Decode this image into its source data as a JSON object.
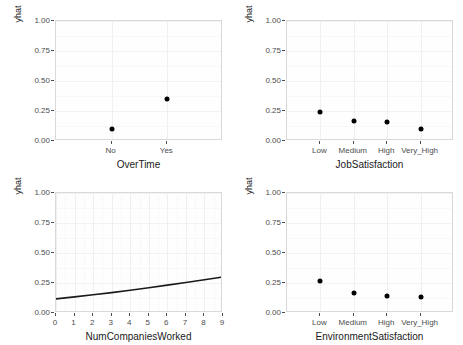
{
  "figure": {
    "width": 463,
    "height": 345,
    "background": "#ffffff",
    "panel_background": "#fefefe",
    "panel_border_color": "#d9d9d9",
    "gridline_major_color": "#f2f2f2",
    "gridline_minor_color": "#f8f8f8",
    "point_color": "#000000",
    "line_color": "#1a1a1a",
    "axis_text_color": "#4d4d4d",
    "axis_title_color": "#1a1a1a"
  },
  "chart_data": [
    {
      "id": "overtime",
      "type": "scatter",
      "title": "",
      "xlabel": "OverTime",
      "ylabel": "yhat",
      "categories": [
        "No",
        "Yes"
      ],
      "values": [
        0.1,
        0.35
      ],
      "ylim": [
        0.0,
        1.0
      ],
      "ytick_labels": [
        "0.00",
        "0.25",
        "0.50",
        "0.75",
        "1.00"
      ],
      "ytick_values": [
        0.0,
        0.25,
        0.5,
        0.75,
        1.0
      ],
      "grid": true,
      "legend": "none"
    },
    {
      "id": "jobsatisfaction",
      "type": "scatter",
      "title": "",
      "xlabel": "JobSatisfaction",
      "ylabel": "yhat",
      "categories": [
        "Low",
        "Medium",
        "High",
        "Very_High"
      ],
      "values": [
        0.245,
        0.17,
        0.16,
        0.1
      ],
      "ylim": [
        0.0,
        1.0
      ],
      "ytick_labels": [
        "0.00",
        "0.25",
        "0.50",
        "0.75",
        "1.00"
      ],
      "ytick_values": [
        0.0,
        0.25,
        0.5,
        0.75,
        1.0
      ],
      "grid": true,
      "legend": "none"
    },
    {
      "id": "numcompaniesworked",
      "type": "line",
      "title": "",
      "xlabel": "NumCompaniesWorked",
      "ylabel": "yhat",
      "x": [
        0,
        1,
        2,
        3,
        4,
        5,
        6,
        7,
        8,
        9
      ],
      "values": [
        0.118,
        0.134,
        0.152,
        0.17,
        0.19,
        0.211,
        0.232,
        0.254,
        0.277,
        0.3
      ],
      "xlim": [
        0,
        9
      ],
      "ylim": [
        0.0,
        1.0
      ],
      "xtick_labels": [
        "0",
        "1",
        "2",
        "3",
        "4",
        "5",
        "6",
        "7",
        "8",
        "9"
      ],
      "ytick_labels": [
        "0.00",
        "0.25",
        "0.50",
        "0.75",
        "1.00"
      ],
      "ytick_values": [
        0.0,
        0.25,
        0.5,
        0.75,
        1.0
      ],
      "grid": true,
      "legend": "none"
    },
    {
      "id": "environmentsatisfaction",
      "type": "scatter",
      "title": "",
      "xlabel": "EnvironmentSatisfaction",
      "ylabel": "yhat",
      "categories": [
        "Low",
        "Medium",
        "High",
        "Very_High"
      ],
      "values": [
        0.27,
        0.165,
        0.14,
        0.13
      ],
      "ylim": [
        0.0,
        1.0
      ],
      "ytick_labels": [
        "0.00",
        "0.25",
        "0.50",
        "0.75",
        "1.00"
      ],
      "ytick_values": [
        0.0,
        0.25,
        0.5,
        0.75,
        1.0
      ],
      "grid": true,
      "legend": "none"
    }
  ]
}
